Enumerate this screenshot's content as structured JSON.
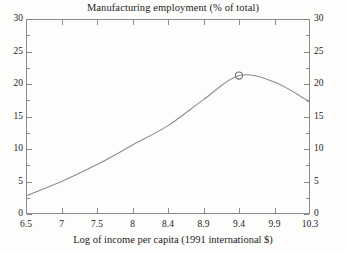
{
  "chart_data": {
    "type": "line",
    "title": "Manufacturing employment (% of total)",
    "xlabel": "Log of income per capita (1991 international $)",
    "ylabel": "",
    "ylim": [
      0,
      30
    ],
    "y_ticks": [
      0,
      5,
      10,
      15,
      20,
      25,
      30
    ],
    "y_ticks_right": [
      0,
      5,
      10,
      15,
      20,
      25,
      30
    ],
    "y_minor_ticks": [
      2.5,
      7.5,
      12.5,
      17.5,
      22.5,
      27.5
    ],
    "x_tick_labels": [
      "6.5",
      "7",
      "7.5",
      "8",
      "8.4",
      "8.9",
      "9.4",
      "9.9",
      "10.3"
    ],
    "grid": false,
    "legend": false,
    "line_color": "#8d8d8d",
    "marker": {
      "x_label": "9.4",
      "value": 21.3,
      "shape": "open-circle",
      "color": "#6f6f6f"
    },
    "series": [
      {
        "name": "Manufacturing employment (% of total)",
        "x_labels": [
          "6.5",
          "7",
          "7.5",
          "8",
          "8.4",
          "8.9",
          "9.4",
          "9.9",
          "10.3"
        ],
        "values": [
          2.8,
          5.0,
          7.6,
          10.6,
          13.6,
          17.6,
          21.3,
          20.3,
          17.2
        ],
        "points": [
          {
            "x": "6.5",
            "y": 2.8
          },
          {
            "x": "7",
            "y": 5.0
          },
          {
            "x": "7.5",
            "y": 7.6
          },
          {
            "x": "8",
            "y": 10.6
          },
          {
            "x": "8.4",
            "y": 13.6
          },
          {
            "x": "8.9",
            "y": 17.6
          },
          {
            "x": "9.4",
            "y": 21.3
          },
          {
            "x": "9.9",
            "y": 20.3
          },
          {
            "x": "10.3",
            "y": 17.2
          }
        ]
      }
    ]
  }
}
